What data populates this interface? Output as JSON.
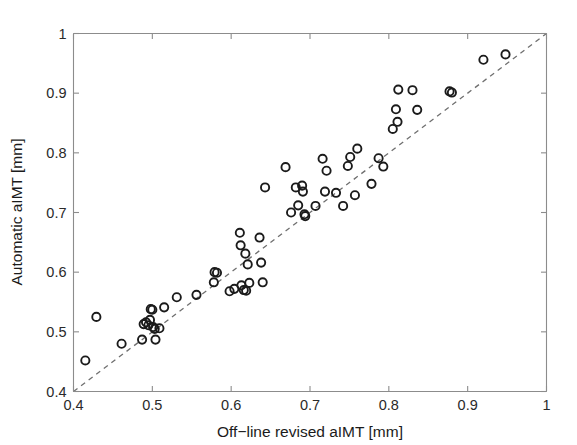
{
  "chart_data": {
    "type": "scatter",
    "title": "",
    "subtitle": "",
    "xlabel": "Off−line revised aIMT [mm]",
    "ylabel": "Automatic aIMT [mm]",
    "xlim": [
      0.4,
      1.0
    ],
    "ylim": [
      0.4,
      1.0
    ],
    "xticks": [
      0.4,
      0.5,
      0.6,
      0.7,
      0.8,
      0.9,
      1.0
    ],
    "yticks": [
      0.4,
      0.5,
      0.6,
      0.7,
      0.8,
      0.9,
      1.0
    ],
    "xtick_labels": [
      "0.4",
      "0.5",
      "0.6",
      "0.7",
      "0.8",
      "0.9",
      "1"
    ],
    "ytick_labels": [
      "0.4",
      "0.5",
      "0.6",
      "0.7",
      "0.8",
      "0.9",
      "1"
    ],
    "grid": false,
    "legend": null,
    "marker": "circle-open",
    "marker_color": "#1b1b1b",
    "reference_line": {
      "name": "identity-line",
      "style": "dashed",
      "color": "#6f6f6f",
      "from": [
        0.4,
        0.4
      ],
      "to": [
        1.0,
        1.0
      ]
    },
    "series": [
      {
        "name": "Automatic vs Off-line revised aIMT",
        "points": [
          [
            0.415,
            0.452
          ],
          [
            0.429,
            0.525
          ],
          [
            0.461,
            0.48
          ],
          [
            0.487,
            0.487
          ],
          [
            0.489,
            0.513
          ],
          [
            0.492,
            0.516
          ],
          [
            0.495,
            0.511
          ],
          [
            0.497,
            0.52
          ],
          [
            0.498,
            0.538
          ],
          [
            0.5,
            0.537
          ],
          [
            0.501,
            0.508
          ],
          [
            0.503,
            0.505
          ],
          [
            0.504,
            0.487
          ],
          [
            0.509,
            0.506
          ],
          [
            0.515,
            0.541
          ],
          [
            0.531,
            0.558
          ],
          [
            0.556,
            0.562
          ],
          [
            0.578,
            0.583
          ],
          [
            0.579,
            0.6
          ],
          [
            0.582,
            0.599
          ],
          [
            0.598,
            0.568
          ],
          [
            0.604,
            0.572
          ],
          [
            0.611,
            0.666
          ],
          [
            0.612,
            0.645
          ],
          [
            0.613,
            0.578
          ],
          [
            0.616,
            0.57
          ],
          [
            0.618,
            0.631
          ],
          [
            0.619,
            0.569
          ],
          [
            0.621,
            0.613
          ],
          [
            0.623,
            0.582
          ],
          [
            0.636,
            0.658
          ],
          [
            0.638,
            0.616
          ],
          [
            0.64,
            0.583
          ],
          [
            0.643,
            0.742
          ],
          [
            0.669,
            0.776
          ],
          [
            0.676,
            0.7
          ],
          [
            0.682,
            0.742
          ],
          [
            0.685,
            0.712
          ],
          [
            0.69,
            0.745
          ],
          [
            0.691,
            0.735
          ],
          [
            0.693,
            0.697
          ],
          [
            0.694,
            0.694
          ],
          [
            0.707,
            0.711
          ],
          [
            0.716,
            0.79
          ],
          [
            0.719,
            0.735
          ],
          [
            0.721,
            0.77
          ],
          [
            0.733,
            0.733
          ],
          [
            0.742,
            0.711
          ],
          [
            0.748,
            0.778
          ],
          [
            0.751,
            0.793
          ],
          [
            0.757,
            0.729
          ],
          [
            0.76,
            0.807
          ],
          [
            0.778,
            0.748
          ],
          [
            0.787,
            0.791
          ],
          [
            0.793,
            0.777
          ],
          [
            0.805,
            0.84
          ],
          [
            0.809,
            0.873
          ],
          [
            0.811,
            0.852
          ],
          [
            0.812,
            0.906
          ],
          [
            0.83,
            0.905
          ],
          [
            0.836,
            0.872
          ],
          [
            0.877,
            0.903
          ],
          [
            0.88,
            0.901
          ],
          [
            0.92,
            0.956
          ],
          [
            0.948,
            0.965
          ]
        ]
      }
    ]
  }
}
